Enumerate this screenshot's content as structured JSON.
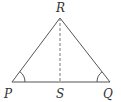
{
  "diagram": {
    "type": "triangle",
    "stroke_color": "#555555",
    "label_color": "#333333",
    "points": {
      "R": {
        "label": "R",
        "x": 60,
        "y": 18
      },
      "P": {
        "label": "P",
        "x": 12,
        "y": 82
      },
      "Q": {
        "label": "Q",
        "x": 110,
        "y": 82
      },
      "S": {
        "label": "S",
        "x": 60,
        "y": 82
      }
    },
    "segments": [
      {
        "from": "P",
        "to": "R",
        "style": "solid"
      },
      {
        "from": "R",
        "to": "Q",
        "style": "solid"
      },
      {
        "from": "P",
        "to": "Q",
        "style": "solid"
      },
      {
        "from": "R",
        "to": "S",
        "style": "dashed"
      }
    ],
    "angle_marks": [
      "P",
      "Q"
    ]
  }
}
